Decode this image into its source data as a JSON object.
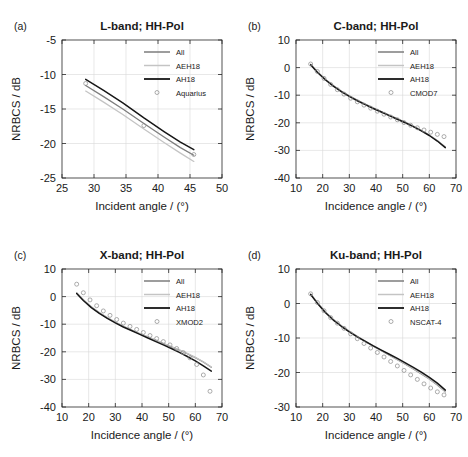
{
  "figure": {
    "panel_tags": [
      "(a)",
      "(b)",
      "(c)",
      "(d)"
    ],
    "colors": {
      "all": "#7d7d7d",
      "aeh18": "#c4c4c4",
      "ah18": "#161616",
      "marker": "#8a8a8a",
      "axis": "#262626",
      "grid": "#d9d9d9"
    }
  },
  "chart_data": [
    {
      "type": "line",
      "panel": "(a)",
      "title": "L-band; HH-Pol",
      "xlabel": "Incident angle / (°)",
      "ylabel": "NRBCS / dB",
      "xlim": [
        25,
        50
      ],
      "ylim": [
        -25,
        -5
      ],
      "xticks": [
        25,
        30,
        35,
        40,
        45,
        50
      ],
      "yticks": [
        -25,
        -20,
        -15,
        -10,
        -5
      ],
      "grid": true,
      "legend": [
        "All",
        "AEH18",
        "AH18",
        "Aquarius"
      ],
      "legend_position": "upper-right",
      "series": [
        {
          "name": "All",
          "style": "line",
          "color": "#7d7d7d",
          "x": [
            28.7,
            31.5,
            34.5,
            37.8,
            41.0,
            43.5,
            45.6
          ],
          "values": [
            -11.6,
            -13.2,
            -15.0,
            -17.1,
            -19.1,
            -20.6,
            -21.7
          ]
        },
        {
          "name": "AEH18",
          "style": "line",
          "color": "#c4c4c4",
          "x": [
            28.7,
            31.5,
            34.5,
            37.8,
            41.0,
            43.5,
            45.6
          ],
          "values": [
            -12.4,
            -14.0,
            -15.8,
            -17.9,
            -19.9,
            -21.4,
            -22.6
          ]
        },
        {
          "name": "AH18",
          "style": "line",
          "color": "#161616",
          "x": [
            28.7,
            31.5,
            34.5,
            37.8,
            41.0,
            43.5,
            45.6
          ],
          "values": [
            -10.7,
            -12.3,
            -14.1,
            -16.3,
            -18.3,
            -19.8,
            -20.9
          ]
        },
        {
          "name": "Aquarius",
          "style": "marker",
          "color": "#8a8a8a",
          "x": [
            28.7,
            37.8,
            45.6
          ],
          "values": [
            -11.3,
            -17.4,
            -21.6
          ]
        }
      ]
    },
    {
      "type": "line",
      "panel": "(b)",
      "title": "C-band; HH-Pol",
      "xlabel": "Incidence angle / (°)",
      "ylabel": "NRBCS / dB",
      "xlim": [
        10,
        70
      ],
      "ylim": [
        -40,
        10
      ],
      "xticks": [
        10,
        20,
        30,
        40,
        50,
        60,
        70
      ],
      "yticks": [
        -40,
        -30,
        -20,
        -10,
        0,
        10
      ],
      "grid": true,
      "legend": [
        "All",
        "AEH18",
        "AH18",
        "CMOD7"
      ],
      "legend_position": "upper-right",
      "series": [
        {
          "name": "All",
          "style": "line",
          "color": "#7d7d7d",
          "x": [
            15.5,
            18,
            21,
            24,
            27,
            30,
            33,
            36,
            39,
            42,
            45,
            48,
            51,
            54,
            57,
            60,
            63,
            66
          ],
          "values": [
            1.1,
            -1.6,
            -4.3,
            -6.6,
            -8.6,
            -10.3,
            -11.9,
            -13.3,
            -14.7,
            -16.0,
            -17.3,
            -18.6,
            -19.9,
            -21.3,
            -22.8,
            -24.5,
            -26.5,
            -28.9
          ]
        },
        {
          "name": "AEH18",
          "style": "line",
          "color": "#c4c4c4",
          "x": [
            15.5,
            18,
            21,
            24,
            27,
            30,
            33,
            36,
            39,
            42,
            45,
            48,
            51,
            54,
            57,
            60,
            63,
            66
          ],
          "values": [
            1.2,
            -1.5,
            -4.2,
            -6.5,
            -8.5,
            -10.2,
            -11.8,
            -13.2,
            -14.6,
            -15.9,
            -17.2,
            -18.5,
            -19.8,
            -21.2,
            -22.7,
            -24.4,
            -26.4,
            -28.8
          ]
        },
        {
          "name": "AH18",
          "style": "line",
          "color": "#161616",
          "x": [
            15.5,
            18,
            21,
            24,
            27,
            30,
            33,
            36,
            39,
            42,
            45,
            48,
            51,
            54,
            57,
            60,
            63,
            66
          ],
          "values": [
            1.0,
            -1.7,
            -4.4,
            -6.7,
            -8.7,
            -10.4,
            -12.0,
            -13.4,
            -14.8,
            -16.1,
            -17.4,
            -18.7,
            -20.0,
            -21.4,
            -22.9,
            -24.6,
            -26.6,
            -29.0
          ]
        },
        {
          "name": "CMOD7",
          "style": "marker",
          "color": "#8a8a8a",
          "x": [
            15.5,
            18,
            20.5,
            23,
            25.5,
            28,
            30.5,
            33,
            35.5,
            38,
            40.5,
            43,
            45.5,
            48,
            50.5,
            53,
            55.5,
            58,
            60.5,
            63,
            65.5
          ],
          "values": [
            1.3,
            -1.4,
            -3.9,
            -6.1,
            -8.0,
            -9.6,
            -11.1,
            -12.4,
            -13.6,
            -14.7,
            -15.8,
            -16.9,
            -17.9,
            -18.9,
            -19.9,
            -20.9,
            -21.8,
            -22.6,
            -23.4,
            -24.2,
            -25.0
          ]
        }
      ]
    },
    {
      "type": "line",
      "panel": "(c)",
      "title": "X-band; HH-Pol",
      "xlabel": "Incidence angle / (°)",
      "ylabel": "NRBCS / dB",
      "xlim": [
        10,
        70
      ],
      "ylim": [
        -40,
        10
      ],
      "xticks": [
        10,
        20,
        30,
        40,
        50,
        60,
        70
      ],
      "yticks": [
        -40,
        -30,
        -20,
        -10,
        0,
        10
      ],
      "grid": true,
      "legend": [
        "All",
        "AEH18",
        "AH18",
        "XMOD2"
      ],
      "legend_position": "upper-right",
      "series": [
        {
          "name": "All",
          "style": "line",
          "color": "#7d7d7d",
          "x": [
            15.5,
            18,
            21,
            24,
            27,
            30,
            33,
            36,
            39,
            42,
            45,
            48,
            51,
            54,
            57,
            60,
            63,
            66
          ],
          "values": [
            1.3,
            -1.2,
            -3.8,
            -5.9,
            -7.7,
            -9.3,
            -10.8,
            -12.1,
            -13.4,
            -14.6,
            -15.8,
            -17.0,
            -18.2,
            -19.4,
            -20.7,
            -22.1,
            -23.7,
            -25.6
          ]
        },
        {
          "name": "AEH18",
          "style": "line",
          "color": "#c4c4c4",
          "x": [
            15.5,
            18,
            21,
            24,
            27,
            30,
            33,
            36,
            39,
            42,
            45,
            48,
            51,
            54,
            57,
            60,
            63,
            66
          ],
          "values": [
            1.4,
            -1.1,
            -3.7,
            -5.8,
            -7.6,
            -9.2,
            -10.7,
            -12.0,
            -13.3,
            -14.5,
            -15.7,
            -16.9,
            -18.1,
            -19.3,
            -20.6,
            -22.0,
            -23.6,
            -25.5
          ]
        },
        {
          "name": "AH18",
          "style": "line",
          "color": "#161616",
          "x": [
            15.5,
            18,
            21,
            24,
            27,
            30,
            33,
            36,
            39,
            42,
            45,
            48,
            51,
            54,
            57,
            60,
            63,
            66
          ],
          "values": [
            1.1,
            -1.4,
            -4.0,
            -6.1,
            -7.9,
            -9.5,
            -11.0,
            -12.3,
            -13.6,
            -14.9,
            -16.2,
            -17.5,
            -18.8,
            -20.2,
            -21.7,
            -23.3,
            -25.1,
            -27.0
          ]
        },
        {
          "name": "XMOD2",
          "style": "marker",
          "color": "#8a8a8a",
          "x": [
            15.5,
            18,
            20.5,
            23,
            25.5,
            28,
            30.5,
            33,
            35.5,
            38,
            40.5,
            43,
            45.5,
            48,
            50.5,
            53,
            55.5,
            58,
            60.5,
            63,
            65.5
          ],
          "values": [
            4.5,
            1.4,
            -1.2,
            -3.3,
            -5.2,
            -6.8,
            -8.3,
            -9.6,
            -10.8,
            -11.9,
            -13.0,
            -14.1,
            -15.2,
            -16.3,
            -17.5,
            -18.8,
            -20.3,
            -22.2,
            -24.6,
            -28.4,
            -34.3
          ]
        }
      ]
    },
    {
      "type": "line",
      "panel": "(d)",
      "title": "Ku-band; HH-Pol",
      "xlabel": "Incidence angle / (°)",
      "ylabel": "NRBCS / dB",
      "xlim": [
        10,
        70
      ],
      "ylim": [
        -30,
        10
      ],
      "xticks": [
        10,
        20,
        30,
        40,
        50,
        60,
        70
      ],
      "yticks": [
        -30,
        -20,
        -10,
        0,
        10
      ],
      "grid": true,
      "legend": [
        "All",
        "AEH18",
        "AH18",
        "NSCAT-4"
      ],
      "legend_position": "upper-right",
      "series": [
        {
          "name": "All",
          "style": "line",
          "color": "#7d7d7d",
          "x": [
            15.5,
            18,
            21,
            24,
            27,
            30,
            33,
            36,
            39,
            42,
            45,
            48,
            51,
            54,
            57,
            60,
            63,
            66
          ],
          "values": [
            2.7,
            0.2,
            -2.5,
            -4.7,
            -6.5,
            -8.1,
            -9.6,
            -11.0,
            -12.4,
            -13.7,
            -15.0,
            -16.3,
            -17.6,
            -19.0,
            -20.4,
            -21.9,
            -23.6,
            -25.6
          ]
        },
        {
          "name": "AEH18",
          "style": "line",
          "color": "#c4c4c4",
          "x": [
            15.5,
            18,
            21,
            24,
            27,
            30,
            33,
            36,
            39,
            42,
            45,
            48,
            51,
            54,
            57,
            60,
            63,
            66
          ],
          "values": [
            2.8,
            0.3,
            -2.4,
            -4.6,
            -6.4,
            -8.0,
            -9.5,
            -10.9,
            -12.3,
            -13.6,
            -14.9,
            -16.2,
            -17.5,
            -18.9,
            -20.3,
            -21.8,
            -23.5,
            -25.5
          ]
        },
        {
          "name": "AH18",
          "style": "line",
          "color": "#161616",
          "x": [
            15.5,
            18,
            21,
            24,
            27,
            30,
            33,
            36,
            39,
            42,
            45,
            48,
            51,
            54,
            57,
            60,
            63,
            66
          ],
          "values": [
            2.6,
            0.1,
            -2.6,
            -4.8,
            -6.6,
            -8.2,
            -9.7,
            -11.0,
            -12.3,
            -13.5,
            -14.7,
            -15.9,
            -17.2,
            -18.5,
            -19.9,
            -21.4,
            -23.1,
            -25.1
          ]
        },
        {
          "name": "NSCAT-4",
          "style": "marker",
          "color": "#8a8a8a",
          "x": [
            15.5,
            18,
            20.5,
            23,
            25.5,
            28,
            30.5,
            33,
            35.5,
            38,
            40.5,
            43,
            45.5,
            48,
            50.5,
            53,
            55.5,
            58,
            60.5,
            63,
            65.5
          ],
          "values": [
            2.8,
            0.3,
            -2.1,
            -4.1,
            -5.7,
            -7.2,
            -8.8,
            -10.2,
            -11.6,
            -12.9,
            -14.2,
            -15.5,
            -16.8,
            -18.1,
            -19.4,
            -20.7,
            -22.0,
            -23.3,
            -24.5,
            -25.6,
            -26.5
          ]
        }
      ]
    }
  ]
}
